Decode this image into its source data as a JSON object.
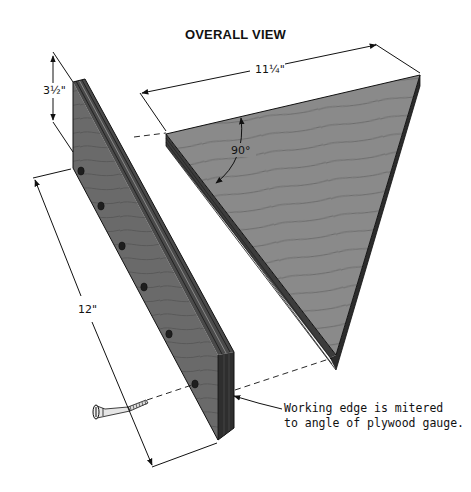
{
  "title": "OVERALL VIEW",
  "dimensions": {
    "board_height": "3½\"",
    "gauge_width": "11¼\"",
    "board_length": "12\"",
    "corner_angle": "90°"
  },
  "callout": {
    "line1": "Working edge is mitered",
    "line2": "to angle of plywood gauge."
  },
  "parts": [
    "fence-board",
    "plywood-triangle-gauge",
    "wood-screw"
  ],
  "colors": {
    "wood_face": "#6f6f6f",
    "wood_edge": "#3a3a3a",
    "gauge_face": "#8a8a8a",
    "line": "#111111"
  }
}
